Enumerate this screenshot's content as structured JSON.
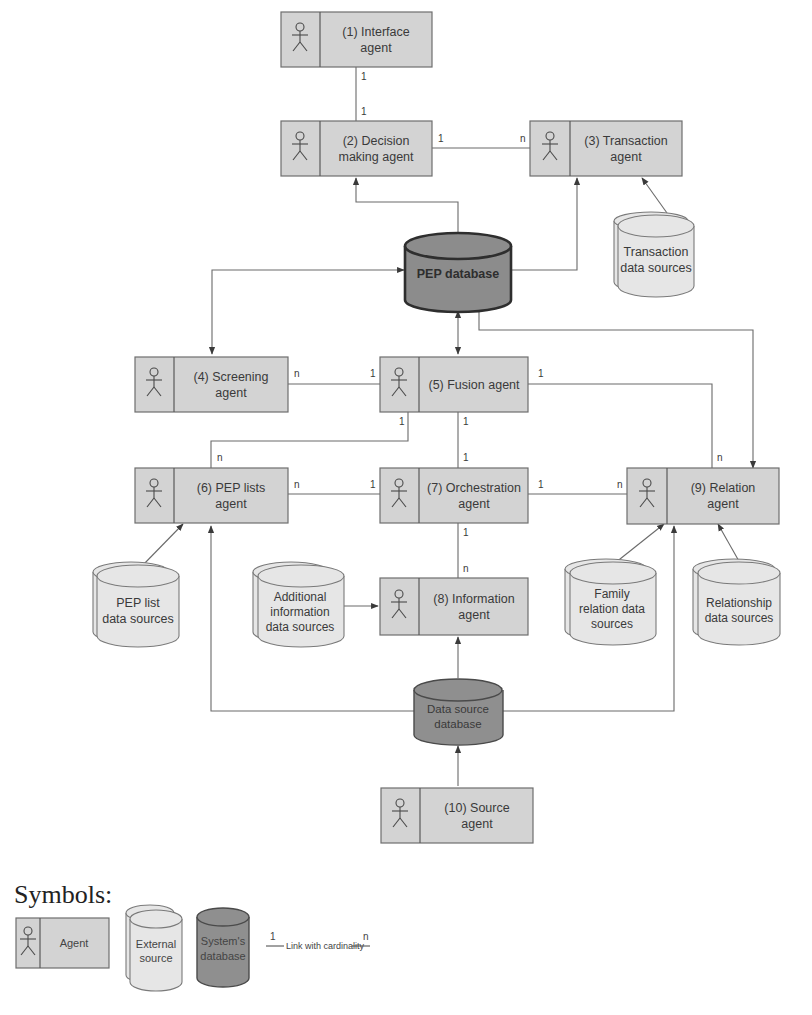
{
  "agents": [
    {
      "id": "interface",
      "line1": "(1) Interface",
      "line2": "agent"
    },
    {
      "id": "decision",
      "line1": "(2) Decision",
      "line2": "making agent"
    },
    {
      "id": "transaction",
      "line1": "(3) Transaction",
      "line2": "agent"
    },
    {
      "id": "screening",
      "line1": "(4) Screening",
      "line2": "agent"
    },
    {
      "id": "fusion",
      "line1": "(5) Fusion agent",
      "line2": ""
    },
    {
      "id": "peplists",
      "line1": "(6) PEP lists",
      "line2": "agent"
    },
    {
      "id": "orchestration",
      "line1": "(7) Orchestration",
      "line2": "agent"
    },
    {
      "id": "information",
      "line1": "(8) Information",
      "line2": "agent"
    },
    {
      "id": "relation",
      "line1": "(9) Relation",
      "line2": "agent"
    },
    {
      "id": "source",
      "line1": "(10) Source",
      "line2": "agent"
    }
  ],
  "external_sources": [
    {
      "id": "transaction-ds",
      "lines": [
        "Transaction",
        "data sources"
      ]
    },
    {
      "id": "peplist-ds",
      "lines": [
        "PEP list",
        "data sources"
      ]
    },
    {
      "id": "additional-ds",
      "lines": [
        "Additional",
        "information",
        "data sources"
      ]
    },
    {
      "id": "family-ds",
      "lines": [
        "Family",
        "relation data",
        "sources"
      ]
    },
    {
      "id": "relationship-ds",
      "lines": [
        "Relationship",
        "data sources"
      ]
    }
  ],
  "system_databases": [
    {
      "id": "pep-db",
      "lines": [
        "PEP database"
      ]
    },
    {
      "id": "datasource-db",
      "lines": [
        "Data source",
        "database"
      ]
    }
  ],
  "cardinalities": {
    "interface_decision": [
      "1",
      "1"
    ],
    "decision_transaction": [
      "1",
      "n"
    ],
    "screening_fusion": [
      "n",
      "1"
    ],
    "fusion_peplists": [
      "1",
      "n"
    ],
    "fusion_orchestration": [
      "1",
      "1"
    ],
    "fusion_relation": [
      "1",
      "n"
    ],
    "peplists_orchestration": [
      "n",
      "1"
    ],
    "orchestration_relation": [
      "1",
      "n"
    ],
    "orchestration_information": [
      "1",
      "n"
    ]
  },
  "legend": {
    "title": "Symbols:",
    "agent": "Agent",
    "external": [
      "External",
      "source"
    ],
    "system": [
      "System's",
      "database"
    ],
    "link_left": "1",
    "link_label": "Link with cardinality",
    "link_right": "n"
  },
  "colors": {
    "agent_fill": "#d3d3d3",
    "external_fill": "#e6e6e6",
    "system_fill": "#8f8f8f",
    "line": "#6a6a6a"
  }
}
